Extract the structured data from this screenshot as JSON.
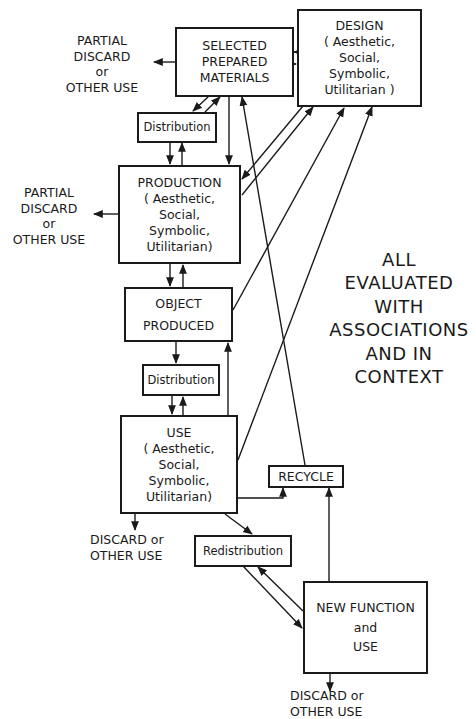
{
  "diagram": {
    "nodes": {
      "materials": {
        "lines": [
          "SELECTED",
          "PREPARED",
          "MATERIALS"
        ]
      },
      "design": {
        "lines": [
          "DESIGN",
          "( Aesthetic,",
          "Social,",
          "Symbolic,",
          "Utilitarian )"
        ]
      },
      "distribution1": {
        "lines": [
          "Distribution"
        ]
      },
      "production": {
        "lines": [
          "PRODUCTION",
          "( Aesthetic,",
          "Social,",
          "Symbolic,",
          "Utilitarian)"
        ]
      },
      "object_produced": {
        "lines": [
          "OBJECT",
          "PRODUCED"
        ]
      },
      "distribution2": {
        "lines": [
          "Distribution"
        ]
      },
      "use": {
        "lines": [
          "USE",
          "( Aesthetic,",
          "Social,",
          "Symbolic,",
          "Utilitarian)"
        ]
      },
      "recycle": {
        "lines": [
          "RECYCLE"
        ]
      },
      "redistribution": {
        "lines": [
          "Redistribution"
        ]
      },
      "new_function": {
        "lines": [
          "NEW FUNCTION",
          "and",
          "USE"
        ]
      }
    },
    "outputs": {
      "materials_discard": {
        "lines": [
          "PARTIAL",
          "DISCARD",
          "or",
          "OTHER USE"
        ]
      },
      "production_discard": {
        "lines": [
          "PARTIAL",
          "DISCARD",
          "or",
          "OTHER USE"
        ]
      },
      "use_discard": {
        "lines": [
          "DISCARD or",
          "OTHER USE"
        ]
      },
      "new_function_discard": {
        "lines": [
          "DISCARD or",
          "OTHER USE"
        ]
      }
    },
    "annotation": {
      "lines": [
        "ALL",
        "EVALUATED",
        "WITH",
        "ASSOCIATIONS",
        "AND IN",
        "CONTEXT"
      ]
    },
    "edges": [
      {
        "from": "materials",
        "to": "design"
      },
      {
        "from": "design",
        "to": "materials"
      },
      {
        "from": "materials",
        "to": "distribution1"
      },
      {
        "from": "distribution1",
        "to": "materials"
      },
      {
        "from": "distribution1",
        "to": "production"
      },
      {
        "from": "production",
        "to": "distribution1"
      },
      {
        "from": "materials",
        "to": "production"
      },
      {
        "from": "design",
        "to": "production"
      },
      {
        "from": "production",
        "to": "design"
      },
      {
        "from": "production",
        "to": "object_produced"
      },
      {
        "from": "object_produced",
        "to": "production"
      },
      {
        "from": "object_produced",
        "to": "design"
      },
      {
        "from": "object_produced",
        "to": "distribution2"
      },
      {
        "from": "distribution2",
        "to": "use"
      },
      {
        "from": "use",
        "to": "distribution2"
      },
      {
        "from": "use",
        "to": "object_produced"
      },
      {
        "from": "use",
        "to": "design"
      },
      {
        "from": "recycle",
        "to": "materials"
      },
      {
        "from": "use",
        "to": "recycle"
      },
      {
        "from": "use",
        "to": "redistribution"
      },
      {
        "from": "redistribution",
        "to": "new_function"
      },
      {
        "from": "new_function",
        "to": "redistribution"
      },
      {
        "from": "new_function",
        "to": "recycle"
      },
      {
        "from": "materials",
        "to": "materials_discard"
      },
      {
        "from": "production",
        "to": "production_discard"
      },
      {
        "from": "use",
        "to": "use_discard"
      },
      {
        "from": "new_function",
        "to": "new_function_discard"
      }
    ]
  }
}
